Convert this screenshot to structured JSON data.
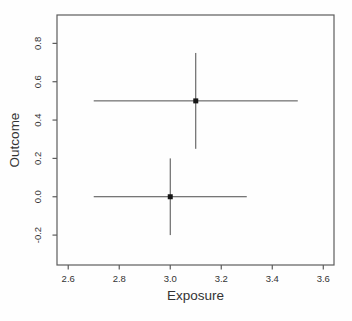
{
  "chart_data": {
    "type": "scatter",
    "title": "",
    "xlabel": "Exposure",
    "ylabel": "Outcome",
    "xlim": [
      2.556,
      3.642
    ],
    "ylim": [
      -0.356,
      0.948
    ],
    "grid": false,
    "legend": null,
    "x_ticks": [
      {
        "value": 2.6,
        "label": "2.6"
      },
      {
        "value": 2.8,
        "label": "2.8"
      },
      {
        "value": 3.0,
        "label": "3.0"
      },
      {
        "value": 3.2,
        "label": "3.2"
      },
      {
        "value": 3.4,
        "label": "3.4"
      },
      {
        "value": 3.6,
        "label": "3.6"
      }
    ],
    "y_ticks": [
      {
        "value": -0.2,
        "label": "-0.2"
      },
      {
        "value": 0.0,
        "label": "0.0"
      },
      {
        "value": 0.2,
        "label": "0.2"
      },
      {
        "value": 0.4,
        "label": "0.4"
      },
      {
        "value": 0.6,
        "label": "0.6"
      },
      {
        "value": 0.8,
        "label": "0.8"
      }
    ],
    "points": [
      {
        "x": 3.1,
        "y": 0.5,
        "x_err_low": 2.7,
        "x_err_high": 3.5,
        "y_err_low": 0.25,
        "y_err_high": 0.75
      },
      {
        "x": 3.0,
        "y": 0.0,
        "x_err_low": 2.7,
        "x_err_high": 3.3,
        "y_err_low": -0.2,
        "y_err_high": 0.2
      }
    ],
    "marker": "filled-square",
    "error_bar_caps": false,
    "colors": {
      "background": "#fefefe",
      "box": "#5c5c5c",
      "tick": "#5c5c5c",
      "error_line": "#4d4d4d",
      "marker": "#161616",
      "text": "#333333"
    }
  }
}
